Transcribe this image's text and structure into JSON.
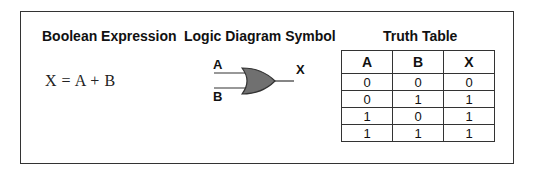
{
  "sections": {
    "expression_heading": "Boolean Expression",
    "diagram_heading": "Logic Diagram Symbol",
    "table_heading": "Truth Table"
  },
  "expression": "X = A + B",
  "diagram": {
    "gate_type": "OR",
    "inputs": [
      "A",
      "B"
    ],
    "output": "X",
    "gate_fill": "#707070"
  },
  "truth_table": {
    "headers": [
      "A",
      "B",
      "X"
    ],
    "rows": [
      [
        "0",
        "0",
        "0"
      ],
      [
        "0",
        "1",
        "1"
      ],
      [
        "1",
        "0",
        "1"
      ],
      [
        "1",
        "1",
        "1"
      ]
    ]
  }
}
